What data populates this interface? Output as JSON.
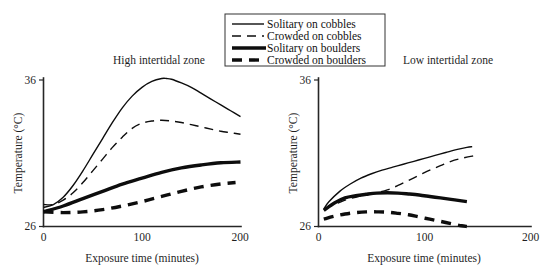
{
  "figure": {
    "legend": {
      "name": "legend",
      "entries": [
        {
          "label": "Solitary on cobbles",
          "style": "thin-solid",
          "key": "solitary_cobbles"
        },
        {
          "label": "Crowded on cobbles",
          "style": "thin-dashed",
          "key": "crowded_cobbles"
        },
        {
          "label": "Solitary on boulders",
          "style": "thick-solid",
          "key": "solitary_boulders"
        },
        {
          "label": "Crowded on boulders",
          "style": "thick-dashed",
          "key": "crowded_boulders"
        }
      ]
    },
    "panels": [
      {
        "id": "high",
        "title": "High intertidal zone"
      },
      {
        "id": "low",
        "title": "Low intertidal zone"
      }
    ],
    "axes": {
      "xlabel": "Exposure time (minutes)",
      "ylabel": "Temperature (°C)",
      "xticks": [
        "0",
        "100",
        "200"
      ],
      "yticks": [
        "36",
        "26"
      ]
    }
  },
  "chart_data": [
    {
      "type": "line",
      "title": "High intertidal zone",
      "xlabel": "Exposure time (minutes)",
      "ylabel": "Temperature (°C)",
      "xlim": [
        0,
        200
      ],
      "ylim": [
        26,
        36
      ],
      "xticks": [
        0,
        100,
        200
      ],
      "yticks": [
        26,
        36
      ],
      "grid": false,
      "legend_position": "top-center-shared",
      "series": [
        {
          "name": "Solitary on cobbles",
          "style": "thin-solid",
          "x": [
            0,
            10,
            20,
            30,
            40,
            50,
            60,
            70,
            80,
            90,
            100,
            110,
            120,
            125,
            130,
            140,
            150,
            160,
            170,
            180,
            190,
            200
          ],
          "y": [
            27.3,
            27.5,
            28.0,
            28.8,
            29.8,
            30.9,
            32.0,
            33.1,
            34.1,
            34.9,
            35.5,
            35.9,
            36.1,
            36.1,
            36.05,
            35.8,
            35.5,
            35.1,
            34.7,
            34.3,
            33.9,
            33.5
          ]
        },
        {
          "name": "Crowded on cobbles",
          "style": "thin-dashed",
          "x": [
            0,
            10,
            20,
            30,
            40,
            50,
            60,
            70,
            80,
            90,
            100,
            110,
            120,
            130,
            140,
            150,
            160,
            170,
            180,
            190,
            200
          ],
          "y": [
            27.5,
            27.5,
            27.8,
            28.3,
            29.0,
            29.8,
            30.6,
            31.4,
            32.1,
            32.7,
            33.05,
            33.2,
            33.25,
            33.2,
            33.1,
            32.95,
            32.8,
            32.65,
            32.5,
            32.4,
            32.3
          ]
        },
        {
          "name": "Solitary on boulders",
          "style": "thick-solid",
          "x": [
            0,
            20,
            40,
            60,
            80,
            100,
            120,
            140,
            160,
            180,
            200
          ],
          "y": [
            27.0,
            27.4,
            27.9,
            28.4,
            28.9,
            29.3,
            29.7,
            30.0,
            30.2,
            30.35,
            30.4
          ]
        },
        {
          "name": "Crowded on boulders",
          "style": "thick-dashed",
          "x": [
            0,
            20,
            40,
            60,
            80,
            100,
            120,
            140,
            160,
            180,
            195
          ],
          "y": [
            27.0,
            26.95,
            27.0,
            27.15,
            27.4,
            27.7,
            28.05,
            28.4,
            28.7,
            28.9,
            29.0
          ]
        }
      ]
    },
    {
      "type": "line",
      "title": "Low intertidal zone",
      "xlabel": "Exposure time (minutes)",
      "ylabel": "Temperature (°C)",
      "xlim": [
        0,
        200
      ],
      "ylim": [
        26,
        36
      ],
      "xticks": [
        0,
        100,
        200
      ],
      "yticks": [
        26,
        36
      ],
      "grid": false,
      "legend_position": "top-center-shared",
      "series": [
        {
          "name": "Solitary on cobbles",
          "style": "thin-solid",
          "x": [
            5,
            10,
            20,
            30,
            40,
            50,
            60,
            70,
            80,
            90,
            100,
            110,
            120,
            130,
            140,
            145
          ],
          "y": [
            27.2,
            27.7,
            28.4,
            28.9,
            29.3,
            29.6,
            29.85,
            30.05,
            30.25,
            30.45,
            30.65,
            30.85,
            31.05,
            31.25,
            31.4,
            31.45
          ]
        },
        {
          "name": "Crowded on cobbles",
          "style": "thin-dashed",
          "x": [
            5,
            15,
            25,
            35,
            45,
            55,
            65,
            75,
            85,
            95,
            105,
            115,
            125,
            135,
            145,
            150
          ],
          "y": [
            27.2,
            27.5,
            27.8,
            28.0,
            28.15,
            28.3,
            28.5,
            28.8,
            29.15,
            29.5,
            29.85,
            30.15,
            30.45,
            30.65,
            30.8,
            30.85
          ]
        },
        {
          "name": "Solitary on boulders",
          "style": "thick-solid",
          "x": [
            5,
            15,
            25,
            35,
            45,
            55,
            65,
            75,
            85,
            95,
            105,
            115,
            125,
            135,
            140
          ],
          "y": [
            27.1,
            27.6,
            27.95,
            28.1,
            28.2,
            28.28,
            28.3,
            28.28,
            28.22,
            28.15,
            28.05,
            27.95,
            27.85,
            27.75,
            27.7
          ]
        },
        {
          "name": "Crowded on boulders",
          "style": "thick-dashed",
          "x": [
            5,
            15,
            25,
            35,
            45,
            55,
            65,
            75,
            85,
            95,
            105,
            115,
            125,
            135,
            140
          ],
          "y": [
            26.5,
            26.7,
            26.85,
            26.95,
            27.0,
            27.0,
            26.98,
            26.9,
            26.8,
            26.65,
            26.5,
            26.35,
            26.2,
            26.05,
            26.0
          ]
        }
      ]
    }
  ]
}
